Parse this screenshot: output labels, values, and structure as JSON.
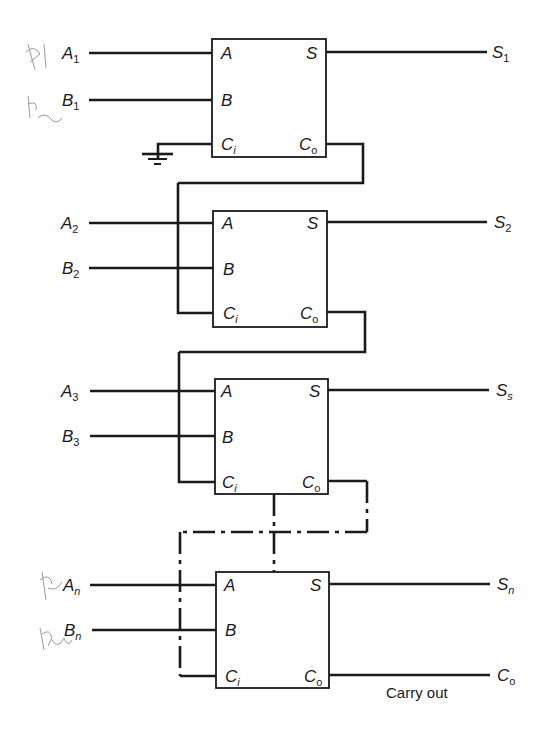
{
  "diagram": {
    "stages": [
      {
        "id": "stage-1",
        "inputs": {
          "a": {
            "base": "A",
            "sub": "1"
          },
          "b": {
            "base": "B",
            "sub": "1"
          }
        },
        "ports": {
          "a": "A",
          "b": "B",
          "ci_base": "C",
          "ci_sub": "i",
          "s": "S",
          "co_base": "C",
          "co_sub": "o"
        },
        "output": {
          "base": "S",
          "sub": "1"
        },
        "carry_in": "ground"
      },
      {
        "id": "stage-2",
        "inputs": {
          "a": {
            "base": "A",
            "sub": "2"
          },
          "b": {
            "base": "B",
            "sub": "2"
          }
        },
        "ports": {
          "a": "A",
          "b": "B",
          "ci_base": "C",
          "ci_sub": "i",
          "s": "S",
          "co_base": "C",
          "co_sub": "o"
        },
        "output": {
          "base": "S",
          "sub": "2"
        }
      },
      {
        "id": "stage-3",
        "inputs": {
          "a": {
            "base": "A",
            "sub": "3"
          },
          "b": {
            "base": "B",
            "sub": "3"
          }
        },
        "ports": {
          "a": "A",
          "b": "B",
          "ci_base": "C",
          "ci_sub": "i",
          "s": "S",
          "co_base": "C",
          "co_sub": "o"
        },
        "output": {
          "base": "S",
          "sub": "s"
        }
      },
      {
        "id": "stage-n",
        "inputs": {
          "a": {
            "base": "A",
            "sub": "n"
          },
          "b": {
            "base": "B",
            "sub": "n"
          }
        },
        "ports": {
          "a": "A",
          "b": "B",
          "ci_base": "C",
          "ci_sub": "i",
          "s": "S",
          "co_base": "C",
          "co_sub": "o"
        },
        "output": {
          "base": "S",
          "sub": "n"
        }
      }
    ],
    "carry_out": {
      "base": "C",
      "sub": "o",
      "caption": "Carry out"
    },
    "handwritten_notes": [
      "A1",
      "b2",
      "An",
      "Bn"
    ],
    "colors": {
      "ink": "#1a1a1a",
      "pencil": "#9a9a9a",
      "background": "#ffffff"
    }
  }
}
